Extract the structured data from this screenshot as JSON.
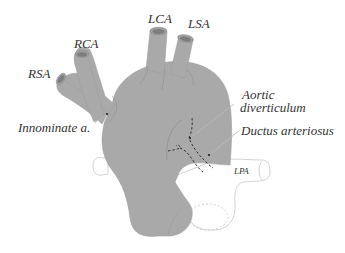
{
  "figure": {
    "colors": {
      "vessel_fill": "#a9a9a9",
      "vessel_edge": "#9a9a9a",
      "lumen_fill": "#808080",
      "pa_outline": "#c8c8c8",
      "dashed": "#333333",
      "leader": "#bdbdbd",
      "text": "#333333"
    },
    "labels": {
      "rsa": "RSA",
      "rca": "RCA",
      "lca": "LCA",
      "lsa": "LSA",
      "innominate": "Innominate a.",
      "aortic_diverticulum_line1": "Aortic",
      "aortic_diverticulum_line2": "diverticulum",
      "ductus": "Ductus arteriosus",
      "lpa": "LPA"
    }
  }
}
